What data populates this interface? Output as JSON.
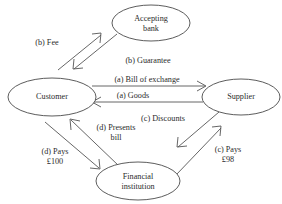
{
  "diagram": {
    "background_color": "#ffffff",
    "stroke_color": "#555555",
    "text_color": "#2b2b2b",
    "nodes": [
      {
        "id": "accepting-bank",
        "label_line1": "Accepting",
        "label_line2": "bank",
        "cx": 151,
        "cy": 23,
        "rx": 39,
        "ry": 18
      },
      {
        "id": "customer",
        "label_line1": "Customer",
        "label_line2": "",
        "cx": 52,
        "cy": 97,
        "rx": 44,
        "ry": 19
      },
      {
        "id": "supplier",
        "label_line1": "Supplier",
        "label_line2": "",
        "cx": 241,
        "cy": 97,
        "rx": 39,
        "ry": 18
      },
      {
        "id": "financial-institution",
        "label_line1": "Financial",
        "label_line2": "institution",
        "cx": 138,
        "cy": 181,
        "rx": 42,
        "ry": 19
      }
    ],
    "edges": [
      {
        "id": "fee",
        "label_line1": "(b) Fee",
        "label_line2": "",
        "from": "customer",
        "to": "accepting-bank",
        "direction": "up-right",
        "label_x": 47,
        "label_y": 43
      },
      {
        "id": "guarantee",
        "label_line1": "(b) Guarantee",
        "label_line2": "",
        "from": "accepting-bank",
        "to": "customer",
        "direction": "down-left",
        "label_x": 148,
        "label_y": 61
      },
      {
        "id": "bill-of-exchange",
        "label_line1": "(a) Bill of exchange",
        "label_line2": "",
        "from": "customer",
        "to": "supplier",
        "direction": "right",
        "label_x": 147,
        "label_y": 80
      },
      {
        "id": "goods",
        "label_line1": "(a) Goods",
        "label_line2": "",
        "from": "supplier",
        "to": "customer",
        "direction": "left",
        "label_x": 133,
        "label_y": 96
      },
      {
        "id": "discounts",
        "label_line1": "(c) Discounts",
        "label_line2": "",
        "from": "supplier",
        "to": "financial-institution",
        "direction": "down-left",
        "label_x": 163,
        "label_y": 119
      },
      {
        "id": "pays-98",
        "label_line1": "(c) Pays",
        "label_line2": "£98",
        "from": "financial-institution",
        "to": "supplier",
        "direction": "up-right",
        "label_x": 228,
        "label_y": 150
      },
      {
        "id": "pays-100",
        "label_line1": "(d) Pays",
        "label_line2": "£100",
        "from": "customer",
        "to": "financial-institution",
        "direction": "down-right",
        "label_x": 55,
        "label_y": 152
      },
      {
        "id": "presents-bill",
        "label_line1": "(d) Presents",
        "label_line2": "bill",
        "from": "financial-institution",
        "to": "customer",
        "direction": "up-left",
        "label_x": 116,
        "label_y": 128
      }
    ]
  }
}
